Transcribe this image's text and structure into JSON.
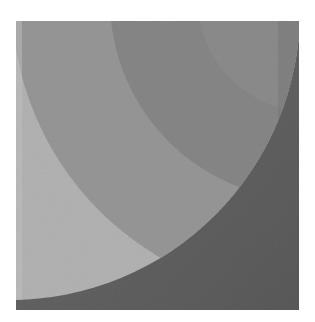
{
  "image": {
    "description": "Grayscale abstract composition of concentric circular arc bands",
    "colors": {
      "background": "#ffffff",
      "outer_dark": "#5f5f5f",
      "band_light": "#b3b3b3",
      "band_medium": "#979797",
      "band_darker": "#878787",
      "inner_corner": "#8c8c8c"
    }
  }
}
